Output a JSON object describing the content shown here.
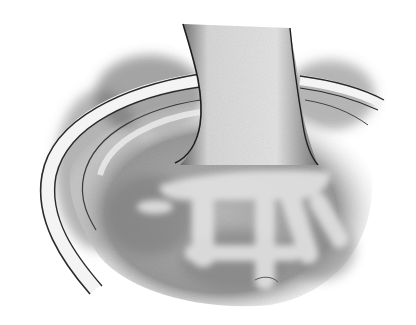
{
  "image": {
    "description": "Pencil/graphite illustration of a hand and wrist submerged in a basin of water",
    "style": "grayscale shaded drawing",
    "subject": "hand-in-water-basin",
    "colors": {
      "background": "#ffffff",
      "dark_shade": "#3a3a3a",
      "mid_shade": "#8a8a8a",
      "light_shade": "#cfcfcf",
      "rim_highlight": "#f2f2f2",
      "outline": "#1e1e1e"
    }
  }
}
